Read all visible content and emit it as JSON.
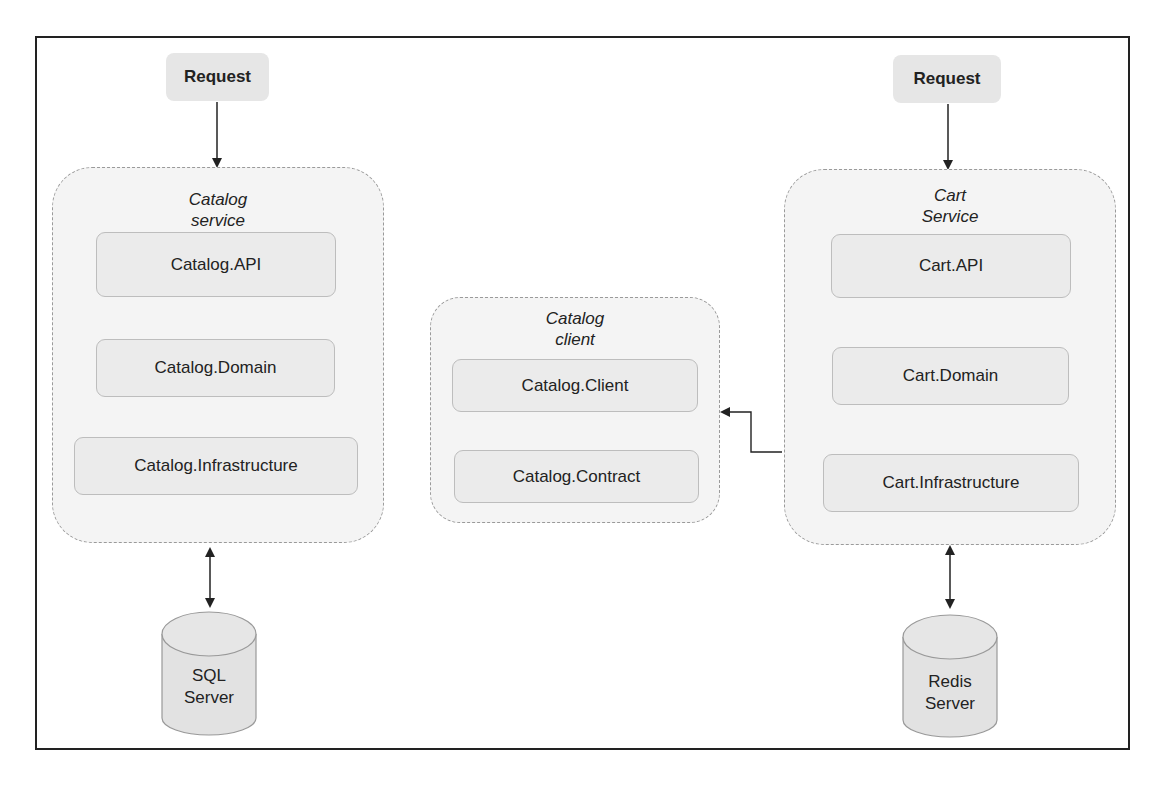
{
  "diagram": {
    "left": {
      "request_label": "Request",
      "group_title_line1": "Catalog",
      "group_title_line2": "service",
      "components": [
        "Catalog.API",
        "Catalog.Domain",
        "Catalog.Infrastructure"
      ],
      "database_line1": "SQL",
      "database_line2": "Server"
    },
    "middle": {
      "group_title_line1": "Catalog",
      "group_title_line2": "client",
      "components": [
        "Catalog.Client",
        "Catalog.Contract"
      ]
    },
    "right": {
      "request_label": "Request",
      "group_title_line1": "Cart",
      "group_title_line2": "Service",
      "components": [
        "Cart.API",
        "Cart.Domain",
        "Cart.Infrastructure"
      ],
      "database_line1": "Redis",
      "database_line2": "Server"
    },
    "connections": [
      {
        "from": "Request",
        "to": "Catalog service",
        "type": "arrow"
      },
      {
        "from": "Catalog.API",
        "to": "Catalog.Domain",
        "type": "line"
      },
      {
        "from": "Catalog.Domain",
        "to": "Catalog.Infrastructure",
        "type": "line"
      },
      {
        "from": "Catalog service",
        "to": "SQL Server",
        "type": "bidirectional"
      },
      {
        "from": "Catalog.Client",
        "to": "Catalog.Contract",
        "type": "line"
      },
      {
        "from": "Cart Service",
        "to": "Catalog client",
        "type": "arrow"
      },
      {
        "from": "Request",
        "to": "Cart Service",
        "type": "arrow"
      },
      {
        "from": "Cart.API",
        "to": "Cart.Domain",
        "type": "line"
      },
      {
        "from": "Cart.Domain",
        "to": "Cart.Infrastructure",
        "type": "line"
      },
      {
        "from": "Cart Service",
        "to": "Redis Server",
        "type": "bidirectional"
      }
    ]
  }
}
